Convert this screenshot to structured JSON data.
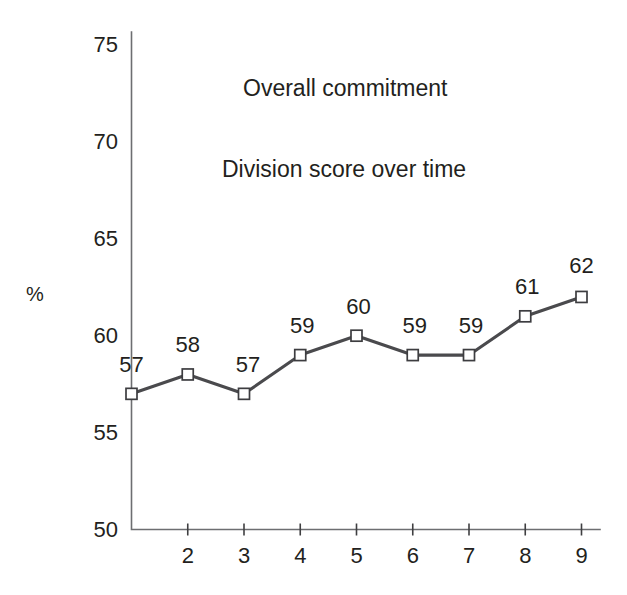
{
  "chart_data": {
    "type": "line",
    "title": "Overall commitment",
    "subtitle": "Division score over time",
    "xlabel": "",
    "ylabel": "%",
    "ylim": [
      50,
      75
    ],
    "xlim": [
      1,
      9
    ],
    "grid": false,
    "legend": "none",
    "y_ticks": [
      75,
      70,
      65,
      60,
      55,
      50
    ],
    "x_ticks": [
      "",
      "2",
      "3",
      "4",
      "5",
      "6",
      "7",
      "8",
      "9"
    ],
    "x": [
      1,
      2,
      3,
      4,
      5,
      6,
      7,
      8,
      9
    ],
    "categories": [
      "1",
      "2",
      "3",
      "4",
      "5",
      "6",
      "7",
      "8",
      "9"
    ],
    "values": [
      57,
      58,
      57,
      59,
      60,
      59,
      59,
      61,
      62
    ],
    "point_labels": [
      "57",
      "58",
      "57",
      "59",
      "60",
      "59",
      "59",
      "61",
      "62"
    ],
    "marker": "open-square",
    "line_color": "#4a4a4d",
    "marker_fill": "#ffffff",
    "marker_stroke": "#3d3d40",
    "axis_color": "#6d6e71",
    "text_color": "#231f20",
    "background": "#ffffff"
  },
  "axes": {
    "y_title": "%",
    "y_tick_labels": [
      "75",
      "70",
      "65",
      "60",
      "55",
      "50"
    ],
    "x_tick_labels": [
      "2",
      "3",
      "4",
      "5",
      "6",
      "7",
      "8",
      "9"
    ]
  },
  "titles": {
    "primary": "Overall commitment",
    "secondary": "Division score over time"
  }
}
